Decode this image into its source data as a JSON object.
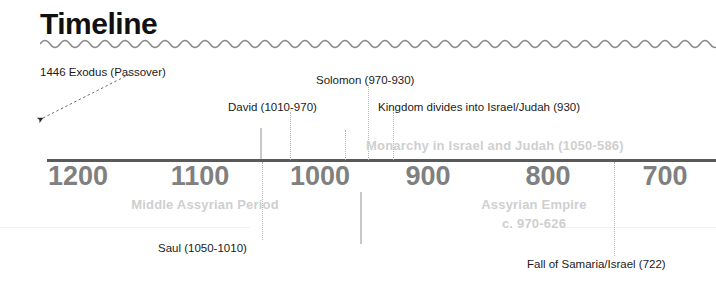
{
  "page": {
    "title": "Timeline",
    "background_color": "#ffffff"
  },
  "colors": {
    "title": "#111111",
    "axis": "#595959",
    "year_label": "#808080",
    "event_label": "#1a1a1a",
    "period_label": "#cfcfcf",
    "leader_line": "#b4b4b4"
  },
  "axis": {
    "years": [
      {
        "label": "1200",
        "x": 78
      },
      {
        "label": "1100",
        "x": 200
      },
      {
        "label": "1000",
        "x": 320
      },
      {
        "label": "900",
        "x": 428
      },
      {
        "label": "800",
        "x": 548
      },
      {
        "label": "700",
        "x": 665
      }
    ]
  },
  "events_above": [
    {
      "text": "1446 Exodus (Passover)",
      "x": 40,
      "y": 66
    },
    {
      "text": "David (1010-970)",
      "x": 228,
      "y": 101
    },
    {
      "text": "Solomon (970-930)",
      "x": 316,
      "y": 74
    },
    {
      "text": "Kingdom divides into Israel/Judah (930)",
      "x": 378,
      "y": 101
    }
  ],
  "events_below": [
    {
      "text": "Saul (1050-1010)",
      "x": 158,
      "y": 242
    },
    {
      "text": "Fall of Samaria/Israel (722)",
      "x": 527,
      "y": 258
    }
  ],
  "periods": [
    {
      "text": "Monarchy in Israel and Judah (1050-586)",
      "x": 366,
      "y": 138,
      "align": "left"
    },
    {
      "text": "Middle Assyrian Period",
      "x": 205,
      "y": 197,
      "align": "center"
    },
    {
      "text": "Assyrian Empire",
      "x": 534,
      "y": 197,
      "align": "center"
    },
    {
      "text": "c. 970-626",
      "x": 534,
      "y": 216,
      "align": "center"
    }
  ],
  "leader_lines": [
    {
      "name": "david-leader",
      "x": 290,
      "y": 112,
      "height": 48
    },
    {
      "name": "solomon-leader",
      "x": 368,
      "y": 85,
      "height": 75
    },
    {
      "name": "kingdom-leader",
      "x": 393,
      "y": 112,
      "height": 48
    },
    {
      "name": "monarchy-leader",
      "x": 368,
      "y": 130,
      "height": 30
    },
    {
      "name": "saul-leader",
      "x": 262,
      "y": 162,
      "height": 78
    },
    {
      "name": "samaria-leader",
      "x": 614,
      "y": 162,
      "height": 94
    }
  ],
  "tick_marks": [
    {
      "name": "tick-above-axis",
      "x": 260,
      "y": 128,
      "height": 31
    },
    {
      "name": "tick-below-axis",
      "x": 360,
      "y": 192,
      "height": 52
    }
  ],
  "arrow": {
    "name": "exodus-pointer",
    "from": "1446 Exodus (Passover)",
    "direction": "down-left"
  }
}
